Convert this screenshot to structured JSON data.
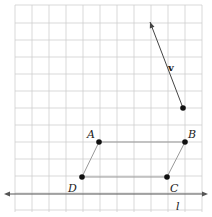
{
  "figure": {
    "grid": {
      "x_lines": [
        15,
        32,
        49,
        66,
        83,
        100,
        117,
        134,
        151,
        168,
        185,
        202
      ],
      "y_lines": [
        5,
        23,
        40,
        57,
        74,
        91,
        108,
        125,
        142,
        159,
        176,
        193,
        210
      ],
      "color": "#cfcfcf"
    },
    "points": {
      "A": {
        "label": "A",
        "x": 99,
        "y": 142
      },
      "B": {
        "label": "B",
        "x": 185,
        "y": 142
      },
      "C": {
        "label": "C",
        "x": 167,
        "y": 177
      },
      "D": {
        "label": "D",
        "x": 82,
        "y": 177
      }
    },
    "parallelogram_color": "#999999",
    "vector": {
      "label": "v",
      "tail_x": 183,
      "tail_y": 108,
      "head_x": 150,
      "head_y": 22,
      "color": "#444444"
    },
    "line": {
      "label": "l",
      "y": 194,
      "x1": 4,
      "x2": 208,
      "color": "#555555"
    }
  }
}
